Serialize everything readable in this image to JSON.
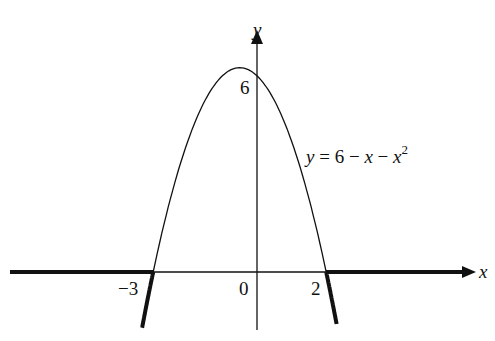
{
  "chart_data": {
    "type": "line",
    "title": "",
    "equation": "y = 6 − x − x²",
    "xlabel": "x",
    "ylabel": "y",
    "series": [
      {
        "name": "y = 6 − x − x²",
        "x": [
          -3.3,
          -3,
          -2,
          -1,
          -0.5,
          0,
          1,
          2,
          2.3
        ],
        "values": [
          -0.99,
          0,
          4,
          6,
          6.25,
          6,
          4,
          0,
          -1.59
        ]
      }
    ],
    "highlighted_regions": [
      {
        "description": "bold: x ≤ -3 on x-axis and curve below axis",
        "x_range": [
          -7,
          -3
        ]
      },
      {
        "description": "bold: x ≥ 2 on x-axis and curve below axis",
        "x_range": [
          2,
          4.5
        ]
      }
    ],
    "tick_labels": {
      "x": [
        "−3",
        "0",
        "2"
      ],
      "y": [
        "6"
      ]
    },
    "grid": false,
    "legend": "none"
  },
  "labels": {
    "x_axis": "x",
    "y_axis": "y",
    "tick_neg3": "−3",
    "tick_0": "0",
    "tick_2": "2",
    "tick_6": "6",
    "eq_y": "y",
    "eq_mid": " = 6 − ",
    "eq_x1": "x",
    "eq_minus": " − ",
    "eq_x2": "x",
    "eq_exp": "2"
  }
}
